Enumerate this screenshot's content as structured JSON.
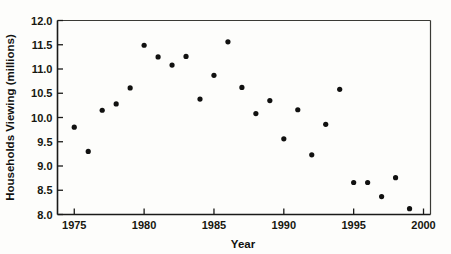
{
  "chart_data": {
    "type": "scatter",
    "title": "",
    "xlabel": "Year",
    "ylabel": "Households Viewing (millions)",
    "xlim": [
      1973.8,
      2000.5
    ],
    "ylim": [
      8.0,
      12.0
    ],
    "xticks": [
      1975,
      1980,
      1985,
      1990,
      1995,
      2000
    ],
    "xtick_labels": [
      "1975",
      "1980",
      "1985",
      "1990",
      "1995",
      "2000"
    ],
    "yticks": [
      8.0,
      8.5,
      9.0,
      9.5,
      10.0,
      10.5,
      11.0,
      11.5,
      12.0
    ],
    "ytick_labels": [
      "8.0",
      "8.5",
      "9.0",
      "9.5",
      "10.0",
      "10.5",
      "11.0",
      "11.5",
      "12.0"
    ],
    "grid": false,
    "legend": false,
    "marker": "filled-circle",
    "marker_color": "#111110",
    "x": [
      1975,
      1976,
      1977,
      1978,
      1979,
      1980,
      1981,
      1982,
      1983,
      1984,
      1985,
      1986,
      1987,
      1988,
      1989,
      1990,
      1991,
      1992,
      1993,
      1994,
      1995,
      1996,
      1997,
      1998,
      1999
    ],
    "values": [
      9.8,
      9.3,
      10.15,
      10.28,
      10.61,
      11.49,
      11.25,
      11.08,
      11.26,
      10.38,
      10.87,
      11.56,
      10.62,
      10.08,
      10.35,
      9.56,
      10.16,
      9.23,
      9.86,
      10.58,
      8.66,
      8.66,
      8.37,
      8.76,
      8.12
    ],
    "points": [
      {
        "year": 1975,
        "households": 9.8
      },
      {
        "year": 1976,
        "households": 9.3
      },
      {
        "year": 1977,
        "households": 10.15
      },
      {
        "year": 1978,
        "households": 10.28
      },
      {
        "year": 1979,
        "households": 10.61
      },
      {
        "year": 1980,
        "households": 11.49
      },
      {
        "year": 1981,
        "households": 11.25
      },
      {
        "year": 1982,
        "households": 11.08
      },
      {
        "year": 1983,
        "households": 11.26
      },
      {
        "year": 1984,
        "households": 10.38
      },
      {
        "year": 1985,
        "households": 10.87
      },
      {
        "year": 1986,
        "households": 11.56
      },
      {
        "year": 1987,
        "households": 10.62
      },
      {
        "year": 1988,
        "households": 10.08
      },
      {
        "year": 1989,
        "households": 10.35
      },
      {
        "year": 1990,
        "households": 9.56
      },
      {
        "year": 1991,
        "households": 10.16
      },
      {
        "year": 1992,
        "households": 9.23
      },
      {
        "year": 1993,
        "households": 9.86
      },
      {
        "year": 1994,
        "households": 10.58
      },
      {
        "year": 1995,
        "households": 8.66
      },
      {
        "year": 1996,
        "households": 8.66
      },
      {
        "year": 1997,
        "households": 8.37
      },
      {
        "year": 1998,
        "households": 8.76
      },
      {
        "year": 1999,
        "households": 8.12
      }
    ],
    "colors": {
      "background": "#fdfdfb",
      "axis": "#1a1a18",
      "frame": "#3a3a35",
      "marker": "#111110",
      "text": "#17170f"
    }
  }
}
